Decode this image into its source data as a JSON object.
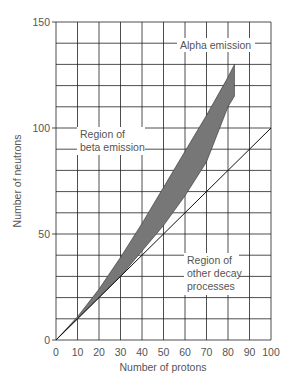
{
  "chart_data": {
    "type": "area",
    "title": "",
    "xlabel": "Number of protons",
    "ylabel": "Number of neutrons",
    "xlim": [
      0,
      100
    ],
    "ylim": [
      0,
      150
    ],
    "grid": true,
    "x_ticks": [
      0,
      10,
      20,
      30,
      40,
      50,
      60,
      70,
      80,
      90,
      100
    ],
    "y_ticks": [
      0,
      50,
      100,
      150
    ],
    "series": [
      {
        "name": "Band of stability (upper edge)",
        "x": [
          0,
          10,
          20,
          30,
          40,
          50,
          60,
          70,
          80,
          83
        ],
        "y": [
          0,
          11,
          24,
          39,
          55,
          72,
          89,
          106,
          124,
          130
        ]
      },
      {
        "name": "Band of stability (lower edge)",
        "x": [
          0,
          10,
          20,
          30,
          40,
          50,
          60,
          70,
          80,
          83
        ],
        "y": [
          0,
          10,
          20,
          30,
          42,
          54,
          68,
          84,
          110,
          115
        ]
      },
      {
        "name": "N = Z line",
        "x": [
          0,
          100
        ],
        "y": [
          0,
          100
        ]
      }
    ],
    "annotations": [
      {
        "text": "Alpha emission",
        "x": 71,
        "y": 140
      },
      {
        "text": "Region of beta emission",
        "x": 20,
        "y": 95
      },
      {
        "text": "Region of other decay processes",
        "x": 73,
        "y": 38
      }
    ],
    "legend": null
  },
  "labels": {
    "xlabel": "Number of protons",
    "ylabel": "Number of neutrons",
    "alpha": "Alpha emission",
    "beta_line1": "Region of",
    "beta_line2": "beta emission",
    "other_line1": "Region of",
    "other_line2": "other decay",
    "other_line3": "processes"
  },
  "ticks": {
    "x": [
      "0",
      "10",
      "20",
      "30",
      "40",
      "50",
      "60",
      "70",
      "80",
      "90",
      "100"
    ],
    "y0": "0",
    "y50": "50",
    "y100": "100",
    "y150": "150"
  },
  "colors": {
    "band": "#777777",
    "grid": "#222222",
    "text": "#555555"
  }
}
